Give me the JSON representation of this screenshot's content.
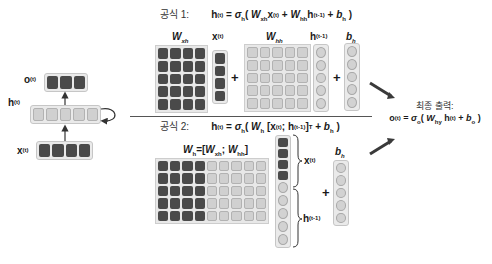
{
  "left_rnn": {
    "output_label": {
      "base": "o",
      "sup": "(t)"
    },
    "hidden_label": {
      "base": "h",
      "sup": "(t)"
    },
    "input_label": {
      "base": "x",
      "sup": "(t)"
    },
    "output_units": 3,
    "hidden_units": 5,
    "input_units": 4
  },
  "formula1": {
    "key": "공식 1:",
    "h": "h",
    "h_sup": "(t)",
    "eq": " = ",
    "sigma": "σ",
    "sigma_sub": "h",
    "open": "( ",
    "W1": "W",
    "W1_sub": "xh",
    "x": "x",
    "x_sup": "(t)",
    "plus": " + ",
    "W2": "W",
    "W2_sub": "hh",
    "hprev": "h",
    "hprev_sup": "(t-1)",
    "plus2": " + ",
    "b": "b",
    "b_sub": "h",
    "close": " )"
  },
  "section1": {
    "wxh_label": {
      "base": "W",
      "sub": "xh"
    },
    "x_label": {
      "base": "x",
      "sup": "(t)"
    },
    "whh_label": {
      "base": "W",
      "sub": "hh"
    },
    "hprev_label": {
      "base": "h",
      "sup": "(t-1)"
    },
    "bh_label": {
      "base": "b",
      "sub": "h"
    },
    "plus": "+"
  },
  "formula2": {
    "key": "공식 2:",
    "h": "h",
    "h_sup": "(t)",
    "eq": " = ",
    "sigma": "σ",
    "sigma_sub": "h",
    "open": "( ",
    "W": "W",
    "W_sub": "h",
    "concat_open": " [x",
    "x_sup": "(t)",
    "sep": "; h",
    "hprev_sup": "(t-1)",
    "concat_close": "]",
    "T": "T",
    "plus": " + ",
    "b": "b",
    "b_sub": "h",
    "close": " )"
  },
  "section2": {
    "wh_label": {
      "base": "W",
      "sub": "h",
      "eq": "=[",
      "a": "W",
      "a_sub": "xh",
      "sep": "; ",
      "b": "W",
      "b_sub": "hh",
      "close": "]"
    },
    "x_brace_label": {
      "base": "x",
      "sup": "(t)"
    },
    "h_brace_label": {
      "base": "h",
      "sup": "(t-1)"
    },
    "bh_label": {
      "base": "b",
      "sub": "h"
    },
    "plus": "+"
  },
  "final_output": {
    "title": "최종 출력:",
    "o": "o",
    "o_sup": "(t)",
    "eq": " = ",
    "sigma": "σ",
    "sigma_sub": "o",
    "open": "( ",
    "W": "W",
    "W_sub": "hy",
    "h": " h",
    "h_sup": "(t)",
    "plus": " + ",
    "b": "b",
    "b_sub": "o",
    "close": " )"
  },
  "colors": {
    "dark_cell": "#4a4a4a",
    "light_cell": "#d0d0d0",
    "frame": "#e6e6e6",
    "arrow": "#3a3a3a"
  }
}
